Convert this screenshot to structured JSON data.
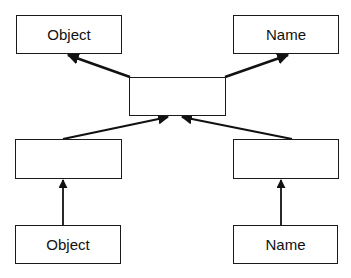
{
  "diagram": {
    "type": "hierarchy",
    "line_color": "#111111",
    "nodes": {
      "top_left": {
        "label": "Object"
      },
      "top_right": {
        "label": "Name"
      },
      "center": {
        "label": ""
      },
      "middle_left": {
        "label": ""
      },
      "middle_right": {
        "label": ""
      },
      "bottom_left": {
        "label": "Object"
      },
      "bottom_right": {
        "label": "Name"
      }
    },
    "edges": [
      {
        "from": "center",
        "to": "top_left"
      },
      {
        "from": "center",
        "to": "top_right"
      },
      {
        "from": "middle_left",
        "to": "center"
      },
      {
        "from": "middle_right",
        "to": "center"
      },
      {
        "from": "bottom_left",
        "to": "middle_left"
      },
      {
        "from": "bottom_right",
        "to": "middle_right"
      }
    ]
  }
}
